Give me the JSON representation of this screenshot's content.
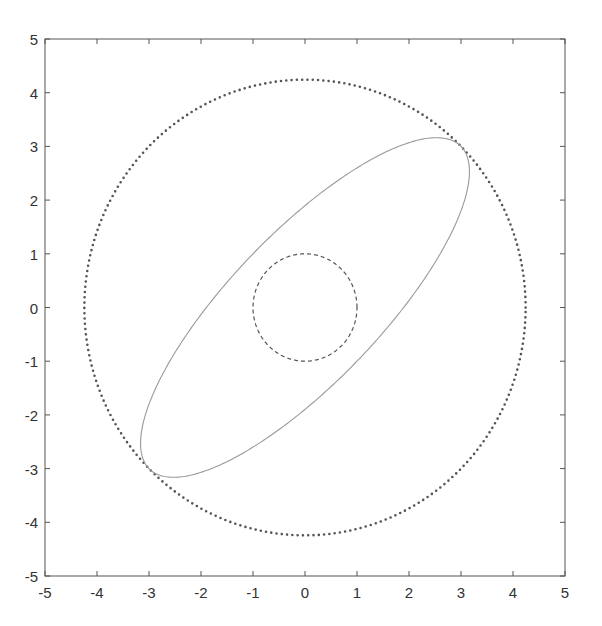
{
  "caption_fragment": "",
  "chart_data": {
    "type": "line",
    "title": "",
    "xlabel": "",
    "ylabel": "",
    "xlim": [
      -5,
      5
    ],
    "ylim": [
      -5,
      5
    ],
    "grid": false,
    "legend": null,
    "xticks": [
      "-5",
      "-4",
      "-3",
      "-2",
      "-1",
      "0",
      "1",
      "2",
      "3",
      "4",
      "5"
    ],
    "yticks": [
      "-5",
      "-4",
      "-3",
      "-2",
      "-1",
      "0",
      "1",
      "2",
      "3",
      "4",
      "5"
    ],
    "series": [
      {
        "name": "outer circle",
        "shape": "circle",
        "center": [
          0,
          0
        ],
        "radius": 4.243,
        "style": "dotted",
        "color": "#555555"
      },
      {
        "name": "ellipse",
        "shape": "ellipse",
        "center": [
          0,
          0
        ],
        "semi_major": 4.243,
        "semi_minor": 1.414,
        "rotation_deg": 45,
        "style": "solid",
        "color": "#999999"
      },
      {
        "name": "unit circle",
        "shape": "circle",
        "center": [
          0,
          0
        ],
        "radius": 1.0,
        "style": "dashed",
        "color": "#555555"
      }
    ]
  }
}
